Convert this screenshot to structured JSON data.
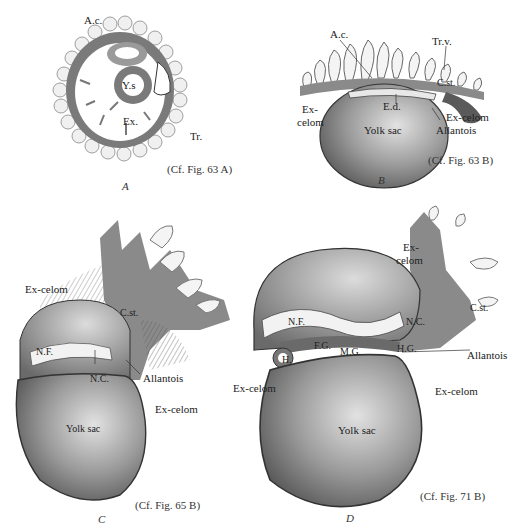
{
  "figure": {
    "panels": [
      {
        "letter": "A",
        "caption": "(Cf. Fig. 63 A)",
        "labels": {
          "ac": "A.c.",
          "ys": "Y.s",
          "ex": "Ex.",
          "tr": "Tr."
        }
      },
      {
        "letter": "B",
        "caption": "(Cf. Fig. 63 B)",
        "labels": {
          "ac": "A.c.",
          "trv": "Tr.v.",
          "cst": "C.st.",
          "ed": "E.d.",
          "excelom_left_1": "Ex-",
          "excelom_left_2": "celom",
          "yolksac": "Yolk sac",
          "excelom_right": "Ex-celom",
          "allantois": "Allantois"
        }
      },
      {
        "letter": "C",
        "caption": "(Cf. Fig. 65 B)",
        "labels": {
          "excelom_top": "Ex-celom",
          "cst": "C.st.",
          "nf": "N.F.",
          "nc": "N.C.",
          "allantois": "Allantois",
          "excelom_right": "Ex-celom",
          "yolksac": "Yolk sac"
        }
      },
      {
        "letter": "D",
        "caption": "(Cf. Fig. 71 B)",
        "labels": {
          "excelom_top_1": "Ex-",
          "excelom_top_2": "celom",
          "cst": "C.st.",
          "nf": "N.F.",
          "nc": "N.C.",
          "h": "H.",
          "fg": "F.G.",
          "mg": "M.G.",
          "hg": "H.G.",
          "allantois": "Allantois",
          "excelom_left": "Ex-celom",
          "excelom_right": "Ex-celom",
          "yolksac": "Yolk sac"
        }
      }
    ],
    "colors": {
      "mesoderm": "#8a8a8a",
      "ink": "#2a2a2a",
      "yolk": "#c9c9c9",
      "villi": "#f2f2f2"
    }
  }
}
